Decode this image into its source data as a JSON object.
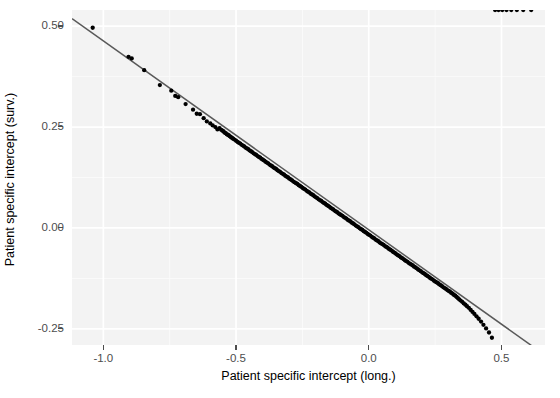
{
  "chart_data": {
    "type": "scatter",
    "title": "",
    "xlabel": "Patient specific intercept (long.)",
    "ylabel": "Patient specific intercept (surv.)",
    "xlim": [
      -1.118,
      0.664
    ],
    "ylim": [
      -0.29,
      0.54
    ],
    "xticks": [
      -1.0,
      -0.5,
      0.0,
      0.5
    ],
    "xticklabels": [
      "-1.0",
      "-0.5",
      "0.0",
      "0.5"
    ],
    "yticks": [
      -0.25,
      0.0,
      0.25,
      0.5
    ],
    "yticklabels": [
      "-0.25",
      "0.00",
      "0.25",
      "0.50"
    ],
    "grid": true,
    "grid_major_color": "#ffffff",
    "grid_minor_color": "#fafafa",
    "panel_background": "#f3f3f3",
    "point_color": "#000000",
    "point_size": 3.4,
    "legend": "none",
    "fit_line": {
      "type": "linear",
      "color": "#595959",
      "slope": -0.468,
      "intercept": -0.0045,
      "x_start": -1.118,
      "x_end": 0.664
    },
    "x": [
      -1.04,
      -0.905,
      -0.893,
      -0.846,
      -0.787,
      -0.744,
      -0.729,
      -0.718,
      -0.69,
      -0.662,
      -0.648,
      -0.636,
      -0.622,
      -0.61,
      -0.597,
      -0.588,
      -0.578,
      -0.57,
      -0.562,
      -0.556,
      -0.551,
      -0.547,
      -0.543,
      -0.539,
      -0.535,
      -0.531,
      -0.527,
      -0.523,
      -0.519,
      -0.515,
      -0.511,
      -0.506,
      -0.5,
      -0.494,
      -0.489,
      -0.484,
      -0.479,
      -0.474,
      -0.469,
      -0.464,
      -0.459,
      -0.454,
      -0.449,
      -0.444,
      -0.439,
      -0.434,
      -0.429,
      -0.424,
      -0.419,
      -0.414,
      -0.409,
      -0.404,
      -0.399,
      -0.394,
      -0.389,
      -0.384,
      -0.379,
      -0.374,
      -0.369,
      -0.364,
      -0.359,
      -0.354,
      -0.349,
      -0.344,
      -0.339,
      -0.334,
      -0.329,
      -0.324,
      -0.319,
      -0.314,
      -0.309,
      -0.304,
      -0.299,
      -0.294,
      -0.289,
      -0.284,
      -0.279,
      -0.274,
      -0.269,
      -0.264,
      -0.259,
      -0.254,
      -0.249,
      -0.244,
      -0.239,
      -0.234,
      -0.229,
      -0.224,
      -0.219,
      -0.214,
      -0.209,
      -0.204,
      -0.199,
      -0.194,
      -0.189,
      -0.184,
      -0.179,
      -0.174,
      -0.169,
      -0.164,
      -0.159,
      -0.154,
      -0.149,
      -0.144,
      -0.139,
      -0.134,
      -0.129,
      -0.124,
      -0.119,
      -0.114,
      -0.109,
      -0.104,
      -0.099,
      -0.094,
      -0.089,
      -0.084,
      -0.079,
      -0.074,
      -0.069,
      -0.064,
      -0.059,
      -0.054,
      -0.049,
      -0.044,
      -0.039,
      -0.034,
      -0.029,
      -0.024,
      -0.019,
      -0.014,
      -0.009,
      -0.004,
      0.001,
      0.006,
      0.011,
      0.016,
      0.021,
      0.026,
      0.031,
      0.036,
      0.041,
      0.046,
      0.051,
      0.056,
      0.061,
      0.066,
      0.071,
      0.076,
      0.081,
      0.086,
      0.091,
      0.096,
      0.101,
      0.106,
      0.111,
      0.116,
      0.121,
      0.126,
      0.131,
      0.136,
      0.141,
      0.146,
      0.151,
      0.156,
      0.161,
      0.166,
      0.171,
      0.176,
      0.181,
      0.186,
      0.191,
      0.196,
      0.201,
      0.206,
      0.211,
      0.216,
      0.221,
      0.226,
      0.231,
      0.236,
      0.241,
      0.246,
      0.251,
      0.256,
      0.261,
      0.266,
      0.271,
      0.276,
      0.281,
      0.286,
      0.291,
      0.296,
      0.301,
      0.306,
      0.311,
      0.316,
      0.321,
      0.326,
      0.331,
      0.336,
      0.341,
      0.346,
      0.352,
      0.358,
      0.364,
      0.37,
      0.377,
      0.384,
      0.391,
      0.398,
      0.406,
      0.414,
      0.423,
      0.432,
      0.442,
      0.453,
      0.464,
      0.476,
      0.489,
      0.503,
      0.519,
      0.537,
      0.558,
      0.582,
      0.612
    ],
    "y": [
      0.496,
      0.424,
      0.42,
      0.391,
      0.354,
      0.34,
      0.327,
      0.324,
      0.307,
      0.293,
      0.283,
      0.282,
      0.272,
      0.264,
      0.259,
      0.254,
      0.25,
      0.244,
      0.247,
      0.243,
      0.241,
      0.239,
      0.236,
      0.235,
      0.232,
      0.231,
      0.229,
      0.227,
      0.225,
      0.223,
      0.221,
      0.219,
      0.216,
      0.213,
      0.211,
      0.209,
      0.206,
      0.204,
      0.202,
      0.199,
      0.197,
      0.195,
      0.192,
      0.19,
      0.188,
      0.185,
      0.183,
      0.181,
      0.178,
      0.176,
      0.174,
      0.171,
      0.169,
      0.167,
      0.164,
      0.162,
      0.16,
      0.157,
      0.155,
      0.153,
      0.15,
      0.148,
      0.146,
      0.143,
      0.141,
      0.139,
      0.136,
      0.134,
      0.132,
      0.129,
      0.127,
      0.125,
      0.122,
      0.12,
      0.118,
      0.115,
      0.113,
      0.111,
      0.109,
      0.106,
      0.104,
      0.102,
      0.099,
      0.097,
      0.095,
      0.092,
      0.09,
      0.088,
      0.085,
      0.083,
      0.081,
      0.078,
      0.076,
      0.074,
      0.071,
      0.069,
      0.067,
      0.064,
      0.062,
      0.06,
      0.057,
      0.055,
      0.053,
      0.05,
      0.048,
      0.046,
      0.043,
      0.041,
      0.039,
      0.036,
      0.034,
      0.032,
      0.03,
      0.027,
      0.025,
      0.023,
      0.02,
      0.018,
      0.016,
      0.013,
      0.011,
      0.009,
      0.006,
      0.004,
      0.002,
      -0.001,
      -0.003,
      -0.005,
      -0.008,
      -0.01,
      -0.012,
      -0.015,
      -0.017,
      -0.019,
      -0.022,
      -0.024,
      -0.026,
      -0.029,
      -0.031,
      -0.033,
      -0.036,
      -0.038,
      -0.04,
      -0.042,
      -0.045,
      -0.047,
      -0.049,
      -0.052,
      -0.054,
      -0.056,
      -0.059,
      -0.061,
      -0.063,
      -0.066,
      -0.068,
      -0.07,
      -0.073,
      -0.075,
      -0.077,
      -0.08,
      -0.082,
      -0.084,
      -0.087,
      -0.089,
      -0.091,
      -0.093,
      -0.096,
      -0.098,
      -0.1,
      -0.103,
      -0.105,
      -0.107,
      -0.11,
      -0.112,
      -0.114,
      -0.117,
      -0.119,
      -0.121,
      -0.124,
      -0.126,
      -0.128,
      -0.131,
      -0.133,
      -0.135,
      -0.137,
      -0.14,
      -0.142,
      -0.144,
      -0.147,
      -0.149,
      -0.151,
      -0.154,
      -0.156,
      -0.158,
      -0.161,
      -0.163,
      -0.166,
      -0.168,
      -0.171,
      -0.174,
      -0.177,
      -0.18,
      -0.183,
      -0.187,
      -0.19,
      -0.194,
      -0.198,
      -0.203,
      -0.208,
      -0.213,
      -0.219,
      -0.225,
      -0.232,
      -0.24,
      -0.249,
      -0.259,
      -0.272
    ]
  },
  "axes": {
    "x_title": "Patient specific intercept (long.)",
    "y_title": "Patient specific intercept (surv.)",
    "x_tick_labels": [
      "-1.0",
      "-0.5",
      "0.0",
      "0.5"
    ],
    "y_tick_labels": [
      "0.50",
      "0.25",
      "0.00",
      "-0.25"
    ]
  }
}
